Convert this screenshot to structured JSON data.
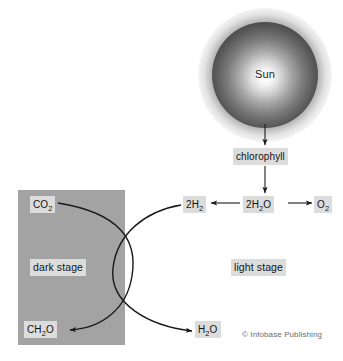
{
  "diagram": {
    "copyright": "© Infobase Publishing",
    "colors": {
      "dark_stage_fill": "#a3a3a3",
      "label_chip_fill": "#dcdcdc",
      "stroke": "#1a1a1a",
      "copyright_text": "#6d6d6d",
      "page_background": "#ffffff"
    },
    "sun": {
      "label": "Sun"
    },
    "stages": {
      "dark_stage_label": "dark stage",
      "light_stage_label": "light stage"
    },
    "nodes": {
      "chlorophyll": "chlorophyll",
      "carbon_dioxide": "CO",
      "carbon_dioxide_sub": "2",
      "formaldehyde": "CH",
      "formaldehyde_sub": "2",
      "formaldehyde_tail": "O",
      "hydrogen": "2H",
      "hydrogen_sub": "2",
      "water_reactant": "2H",
      "water_reactant_sub": "2",
      "water_reactant_tail": "O",
      "oxygen": "O",
      "oxygen_sub": "2",
      "water_product": "H",
      "water_product_sub": "2",
      "water_product_tail": "O"
    },
    "arrows": [
      {
        "name": "sun-to-chlorophyll",
        "from": "Sun",
        "to": "chlorophyll",
        "kind": "straight-down"
      },
      {
        "name": "chlorophyll-to-water",
        "from": "chlorophyll",
        "to": "2H2O",
        "kind": "straight-down"
      },
      {
        "name": "water-to-hydrogen",
        "from": "2H2O",
        "to": "2H2",
        "kind": "straight-left"
      },
      {
        "name": "water-to-oxygen",
        "from": "2H2O",
        "to": "O2",
        "kind": "straight-right"
      },
      {
        "name": "co2-to-ch2o",
        "from": "CO2",
        "to": "CH2O",
        "kind": "curved-arc"
      },
      {
        "name": "hydrogen-to-water",
        "from": "2H2",
        "to": "H2O",
        "kind": "curved-arc"
      }
    ]
  }
}
